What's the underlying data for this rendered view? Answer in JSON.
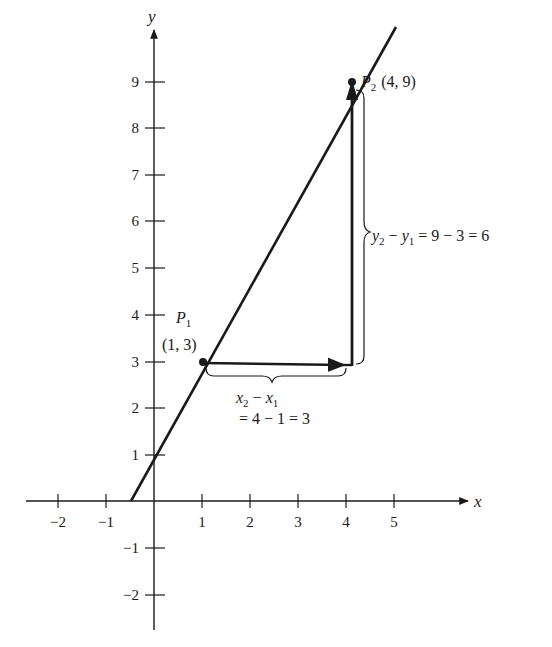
{
  "chart_data": {
    "type": "line",
    "title": "",
    "xlabel": "x",
    "ylabel": "y",
    "xlim": [
      -2.5,
      6.3
    ],
    "ylim": [
      -2.6,
      10.3
    ],
    "grid": false,
    "x_ticks": [
      -2,
      -1,
      1,
      2,
      3,
      4,
      5
    ],
    "y_ticks": [
      -2,
      -1,
      1,
      2,
      3,
      4,
      5,
      6,
      7,
      8,
      9
    ],
    "x_tick_labels": [
      "−2",
      "−1",
      "1",
      "2",
      "3",
      "4",
      "5"
    ],
    "y_tick_labels": [
      "−2",
      "−1",
      "1",
      "2",
      "3",
      "4",
      "5",
      "6",
      "7",
      "8",
      "9"
    ],
    "series": [
      {
        "name": "line through P1 and P2",
        "x": [
          -0.5,
          1,
          4,
          4.4
        ],
        "y": [
          0,
          3,
          9,
          9.8
        ]
      }
    ],
    "points": [
      {
        "name": "P1",
        "x": 1,
        "y": 3,
        "label": "(1, 3)"
      },
      {
        "name": "P2",
        "x": 4,
        "y": 9,
        "label": "(4, 9)"
      }
    ],
    "annotations": [
      {
        "text": "x2 − x1 = 4 − 1 = 3",
        "type": "horizontal arrow from P1 to (4,3) with brace"
      },
      {
        "text": "y2 − y1 = 9 − 3 = 6",
        "type": "vertical arrow from (4,3) to P2 with brace"
      }
    ]
  },
  "labels": {
    "x_axis": "x",
    "y_axis": "y",
    "p1_name": "P",
    "p1_sub": "1",
    "p1_coords": "(1, 3)",
    "p2_name": "P",
    "p2_sub": "2",
    "p2_coords": "(4, 9)",
    "dx_line1_a": "x",
    "dx_line1_a_sub": "2",
    "dx_line1_op": " − ",
    "dx_line1_b": "x",
    "dx_line1_b_sub": "1",
    "dx_line2": "= 4 − 1 = 3",
    "dy_a": "y",
    "dy_a_sub": "2",
    "dy_op": " − ",
    "dy_b": "y",
    "dy_b_sub": "1",
    "dy_rest": " = 9 − 3 = 6"
  },
  "ticks": {
    "x": [
      {
        "label": "−2",
        "px": 58
      },
      {
        "label": "−1",
        "px": 106
      },
      {
        "label": "1",
        "px": 202
      },
      {
        "label": "2",
        "px": 250
      },
      {
        "label": "3",
        "px": 298
      },
      {
        "label": "4",
        "px": 346
      },
      {
        "label": "5",
        "px": 394
      }
    ],
    "y": [
      {
        "label": "9",
        "py": 82
      },
      {
        "label": "8",
        "py": 128
      },
      {
        "label": "7",
        "py": 175
      },
      {
        "label": "6",
        "py": 221
      },
      {
        "label": "5",
        "py": 268
      },
      {
        "label": "4",
        "py": 315
      },
      {
        "label": "3",
        "py": 362
      },
      {
        "label": "2",
        "py": 408
      },
      {
        "label": "1",
        "py": 455
      },
      {
        "label": "−1",
        "py": 548
      },
      {
        "label": "−2",
        "py": 595
      }
    ]
  },
  "colors": {
    "ink": "#1a1a1a",
    "background": "#ffffff"
  }
}
